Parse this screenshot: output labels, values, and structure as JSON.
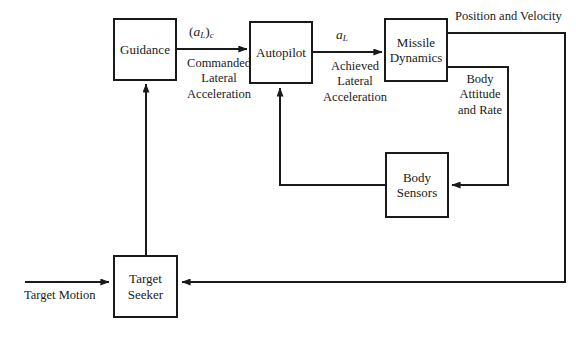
{
  "diagram": {
    "background_color": "#ffffff",
    "line_color": "#1a1a1a",
    "blocks": [
      {
        "id": "guidance",
        "label": "Guidance",
        "label_line1": "Guidance",
        "label_line2": ""
      },
      {
        "id": "autopilot",
        "label": "Autopilot",
        "label_line1": "Autopilot",
        "label_line2": ""
      },
      {
        "id": "missile_dynamics",
        "label": "Missile Dynamics",
        "label_line1": "Missile",
        "label_line2": "Dynamics"
      },
      {
        "id": "body_sensors",
        "label": "Body Sensors",
        "label_line1": "Body",
        "label_line2": "Sensors"
      },
      {
        "id": "target_seeker",
        "label": "Target Seeker",
        "label_line1": "Target",
        "label_line2": "Seeker"
      }
    ],
    "signals": {
      "commanded_symbol_open": "(",
      "commanded_symbol_a": "a",
      "commanded_symbol_sub_L": "L",
      "commanded_symbol_close": ")",
      "commanded_symbol_sub_c": "c",
      "commanded_text_line1": "Commanded",
      "commanded_text_line2": "Lateral",
      "commanded_text_line3": "Acceleration",
      "achieved_symbol_a": "a",
      "achieved_symbol_sub_L": "L",
      "achieved_text_line1": "Achieved",
      "achieved_text_line2": "Lateral",
      "achieved_text_line3": "Acceleration",
      "position_velocity": "Position and Velocity",
      "body_attitude_line1": "Body",
      "body_attitude_line2": "Attitude",
      "body_attitude_line3": "and Rate",
      "target_motion": "Target Motion"
    }
  }
}
